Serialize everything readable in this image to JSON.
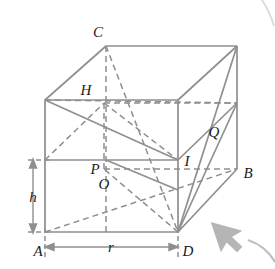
{
  "figure": {
    "type": "geometry-diagram",
    "colors": {
      "solid_edge": "#8c8c8c",
      "hidden_edge": "#8c8c8c",
      "dimension_line": "#8c8c8c",
      "label_text": "#1a1a1a",
      "cursor": "#b3b3b3",
      "background": "#ffffff"
    },
    "labels": {
      "C": "C",
      "H": "H",
      "Q": "Q",
      "P": "P",
      "O": "O",
      "I": "I",
      "B": "B",
      "A": "A",
      "D": "D"
    },
    "dimensions": {
      "height_label": "h",
      "radius_label": "r"
    },
    "points": {
      "A": {
        "x": 45,
        "y": 232
      },
      "D": {
        "x": 178,
        "y": 232
      },
      "B": {
        "x": 237,
        "y": 170
      },
      "C": {
        "x": 106,
        "y": 44
      },
      "H": {
        "x": 106,
        "y": 100
      },
      "P": {
        "x": 106,
        "y": 160
      },
      "O": {
        "x": 106,
        "y": 160
      },
      "I": {
        "x": 178,
        "y": 160
      },
      "Q": {
        "x": 208,
        "y": 130
      }
    },
    "cursor": {
      "name": "mouse-pointer",
      "x": 215,
      "y": 218
    }
  }
}
